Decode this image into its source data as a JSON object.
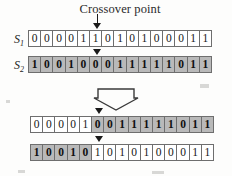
{
  "diagram": {
    "title": "Crossover point",
    "arrow_icon": "down-arrow-icon",
    "marker_icon": "crossover-marker-icon",
    "crossover_position": 5,
    "string_length": 15,
    "colors": {
      "shaded_cell": "#b9b9b9",
      "plain_cell": "#ffffff",
      "border": "#6e6e6e",
      "text": "#161616"
    },
    "parents": [
      {
        "label": "S",
        "subscript": "1",
        "bits": [
          "0",
          "0",
          "0",
          "0",
          "1",
          "1",
          "0",
          "1",
          "0",
          "1",
          "0",
          "0",
          "0",
          "1",
          "1"
        ],
        "shading": [
          "plain",
          "plain",
          "plain",
          "plain",
          "plain",
          "plain",
          "plain",
          "plain",
          "plain",
          "plain",
          "plain",
          "plain",
          "plain",
          "plain",
          "plain"
        ]
      },
      {
        "label": "S",
        "subscript": "2",
        "bits": [
          "1",
          "0",
          "0",
          "1",
          "0",
          "0",
          "0",
          "1",
          "1",
          "1",
          "1",
          "1",
          "0",
          "1",
          "1"
        ],
        "shading": [
          "shaded",
          "shaded",
          "shaded",
          "shaded",
          "shaded",
          "shaded",
          "shaded",
          "shaded",
          "shaded",
          "shaded",
          "shaded",
          "shaded",
          "shaded",
          "shaded",
          "shaded"
        ]
      }
    ],
    "offspring": [
      {
        "bits": [
          "0",
          "0",
          "0",
          "0",
          "1",
          "0",
          "0",
          "1",
          "1",
          "1",
          "1",
          "1",
          "0",
          "1",
          "1"
        ],
        "shading": [
          "plain",
          "plain",
          "plain",
          "plain",
          "plain",
          "shaded",
          "shaded",
          "shaded",
          "shaded",
          "shaded",
          "shaded",
          "shaded",
          "shaded",
          "shaded",
          "shaded"
        ]
      },
      {
        "bits": [
          "1",
          "0",
          "0",
          "1",
          "0",
          "1",
          "0",
          "1",
          "0",
          "1",
          "0",
          "0",
          "0",
          "1",
          "1"
        ],
        "shading": [
          "shaded",
          "shaded",
          "shaded",
          "shaded",
          "shaded",
          "plain",
          "plain",
          "plain",
          "plain",
          "plain",
          "plain",
          "plain",
          "plain",
          "plain",
          "plain"
        ]
      }
    ]
  }
}
